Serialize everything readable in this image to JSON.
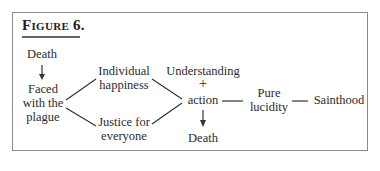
{
  "figure": {
    "title": "Figure 6.",
    "nodes": {
      "death_top": "Death",
      "faced_line1": "Faced",
      "faced_line2": "with the",
      "faced_line3": "plague",
      "individual_line1": "Individual",
      "individual_line2": "happiness",
      "justice_line1": "Justice for",
      "justice_line2": "everyone",
      "understanding": "Understanding",
      "plus": "+",
      "action": "action",
      "death_bottom": "Death",
      "pure_line1": "Pure",
      "pure_line2": "lucidity",
      "sainthood": "Sainthood"
    },
    "edges": [
      {
        "from": "Death",
        "to": "Faced with the plague",
        "type": "arrow"
      },
      {
        "from": "Faced with the plague",
        "to": "Individual happiness",
        "type": "line"
      },
      {
        "from": "Faced with the plague",
        "to": "Justice for everyone",
        "type": "line"
      },
      {
        "from": "Individual happiness",
        "to": "Understanding + action",
        "type": "line"
      },
      {
        "from": "Justice for everyone",
        "to": "Understanding + action",
        "type": "line"
      },
      {
        "from": "Understanding + action",
        "to": "Death",
        "type": "arrow"
      },
      {
        "from": "Understanding + action",
        "to": "Pure lucidity",
        "type": "line"
      },
      {
        "from": "Pure lucidity",
        "to": "Sainthood",
        "type": "line"
      }
    ],
    "colors": {
      "border": "#8a8a8a",
      "text": "#2b2b2b",
      "line": "#333333"
    }
  }
}
